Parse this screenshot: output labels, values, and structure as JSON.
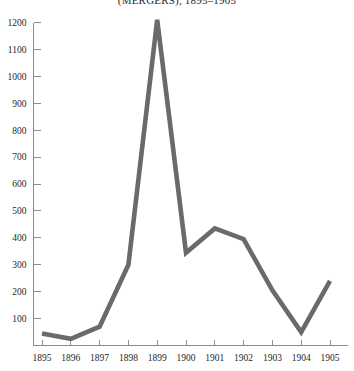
{
  "chart_data": {
    "type": "line",
    "title": "(MERGERS), 1895–1905",
    "xlabel": "",
    "ylabel": "",
    "categories": [
      "1895",
      "1896",
      "1897",
      "1898",
      "1899",
      "1900",
      "1901",
      "1902",
      "1903",
      "1904",
      "1905"
    ],
    "x": [
      1895,
      1896,
      1897,
      1898,
      1899,
      1900,
      1901,
      1902,
      1903,
      1904,
      1905
    ],
    "values": [
      45,
      25,
      70,
      300,
      1210,
      345,
      435,
      395,
      205,
      50,
      240
    ],
    "series": [
      {
        "name": "Mergers",
        "values": [
          45,
          25,
          70,
          300,
          1210,
          345,
          435,
          395,
          205,
          50,
          240
        ]
      }
    ],
    "ylim": [
      0,
      1200
    ],
    "xlim": [
      1895,
      1905
    ],
    "yticks": [
      100,
      200,
      300,
      400,
      500,
      600,
      700,
      800,
      900,
      1000,
      1100,
      1200
    ],
    "ytick_labels": [
      "100",
      "200",
      "300",
      "400",
      "500",
      "600",
      "700",
      "800",
      "900",
      "1000",
      "1100",
      "1200"
    ],
    "xtick_labels": [
      "1895",
      "1896",
      "1897",
      "1898",
      "1899",
      "1900",
      "1901",
      "1902",
      "1903",
      "1904",
      "1905"
    ],
    "grid": false,
    "legend": false,
    "legend_position": "none",
    "line_color": "#6a6a6a",
    "axis_color": "#8d8d8d",
    "text_color": "#1f1f1f",
    "background_color": "#ffffff"
  }
}
